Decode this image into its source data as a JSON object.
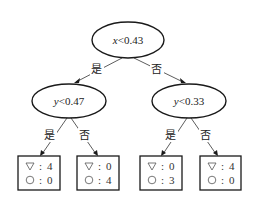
{
  "diagram": {
    "type": "decision-tree",
    "root": {
      "variable": "x",
      "condition": "<0.43",
      "yes_label": "是",
      "no_label": "否"
    },
    "left": {
      "variable": "y",
      "condition": "<0.47",
      "yes_label": "是",
      "no_label": "否"
    },
    "right": {
      "variable": "y",
      "condition": "<0.33",
      "yes_label": "是",
      "no_label": "否"
    },
    "leaves": [
      {
        "triangle_label": ":",
        "triangle_count": "4",
        "circle_label": ":",
        "circle_count": "0"
      },
      {
        "triangle_label": ":",
        "triangle_count": "0",
        "circle_label": ":",
        "circle_count": "4"
      },
      {
        "triangle_label": ":",
        "triangle_count": "0",
        "circle_label": ":",
        "circle_count": "3"
      },
      {
        "triangle_label": ":",
        "triangle_count": "4",
        "circle_label": ":",
        "circle_count": "0"
      }
    ],
    "legend_symbols": {
      "triangle": "down-triangle",
      "circle": "circle"
    }
  }
}
